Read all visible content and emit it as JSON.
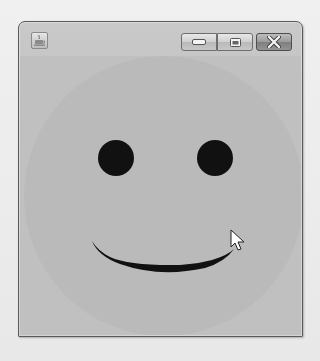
{
  "window": {
    "title": "",
    "app_icon": "java-coffee-cup-icon",
    "controls": {
      "minimize": "minimize-icon",
      "maximize": "maximize-icon",
      "close": "close-icon"
    }
  },
  "canvas": {
    "drawing": "smiley-face",
    "face": {
      "cx": 144,
      "cy": 140,
      "r": 140,
      "color": "#bababa"
    },
    "left_eye": {
      "cx": 96,
      "cy": 102,
      "r": 18,
      "color": "#111111"
    },
    "right_eye": {
      "cx": 195,
      "cy": 102,
      "r": 18,
      "color": "#111111"
    },
    "mouth": {
      "color": "#111111",
      "start_x": 72,
      "start_y": 185,
      "end_x": 214,
      "end_y": 193,
      "bottom_y": 217
    },
    "background_color": "#c0c0c0"
  },
  "cursor": {
    "type": "arrow-pointer",
    "x": 230,
    "y": 229
  }
}
